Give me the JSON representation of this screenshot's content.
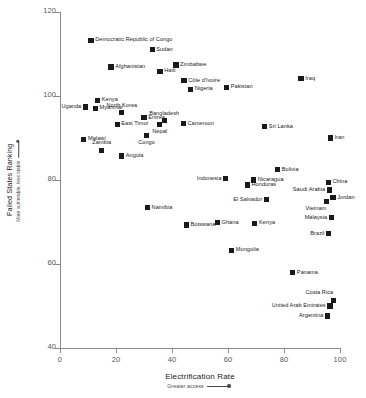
{
  "chart_data": {
    "type": "scatter",
    "title": "",
    "xlabel": "Electrification Rate",
    "xlabel_sub": "Greater access",
    "ylabel": "Failed States Ranking",
    "ylabel_sub": "More vulnerable, less stable",
    "xlim": [
      0,
      100
    ],
    "ylim": [
      40,
      120
    ],
    "xticks": [
      0,
      20,
      40,
      60,
      80,
      100
    ],
    "yticks": [
      40,
      60,
      80,
      100,
      120
    ],
    "grid": false,
    "legend": "none",
    "points": [
      {
        "label": "Democratic Republic of Congo",
        "x": 11.1,
        "y": 113.3,
        "pos": "lab-right"
      },
      {
        "label": "Sudan",
        "x": 32.9,
        "y": 111.0,
        "pos": "lab-right"
      },
      {
        "label": "Zimbabwe",
        "x": 41.4,
        "y": 107.4,
        "pos": "lab-right"
      },
      {
        "label": "Afghanistan",
        "x": 18.2,
        "y": 106.9,
        "pos": "lab-right"
      },
      {
        "label": "Haiti",
        "x": 35.7,
        "y": 105.9,
        "pos": "lab-right"
      },
      {
        "label": "Côte d'Ivoire",
        "x": 44.3,
        "y": 103.6,
        "pos": "lab-right"
      },
      {
        "label": "Iraq",
        "x": 86.1,
        "y": 104.1,
        "pos": "lab-right"
      },
      {
        "label": "Nigeria",
        "x": 46.6,
        "y": 101.6,
        "pos": "lab-right"
      },
      {
        "label": "Pakistan",
        "x": 59.5,
        "y": 102.1,
        "pos": "lab-right"
      },
      {
        "label": "Kenya",
        "x": 13.4,
        "y": 99.0,
        "pos": "lab-right"
      },
      {
        "label": "Uganda",
        "x": 9.1,
        "y": 97.4,
        "pos": "lab-left"
      },
      {
        "label": "Myanmar",
        "x": 12.6,
        "y": 97.1,
        "pos": "lab-right"
      },
      {
        "label": "North Korea",
        "x": 22.1,
        "y": 96.1,
        "pos": "lab-above"
      },
      {
        "label": "Eritrea",
        "x": 30.0,
        "y": 94.9,
        "pos": "lab-right"
      },
      {
        "label": "Bangladesh",
        "x": 37.2,
        "y": 94.2,
        "pos": "lab-above"
      },
      {
        "label": "East Timor",
        "x": 20.4,
        "y": 93.3,
        "pos": "lab-right"
      },
      {
        "label": "Cameroon",
        "x": 44.0,
        "y": 93.4,
        "pos": "lab-right"
      },
      {
        "label": "Nepal",
        "x": 35.6,
        "y": 93.2,
        "pos": "lab-below"
      },
      {
        "label": "Sri Lanka",
        "x": 73.1,
        "y": 92.7,
        "pos": "lab-right"
      },
      {
        "label": "Congo",
        "x": 30.9,
        "y": 90.6,
        "pos": "lab-below"
      },
      {
        "label": "Iran",
        "x": 96.6,
        "y": 90.0,
        "pos": "lab-right"
      },
      {
        "label": "Malawi",
        "x": 8.5,
        "y": 89.7,
        "pos": "lab-right"
      },
      {
        "label": "Zambia",
        "x": 14.9,
        "y": 87.1,
        "pos": "lab-above"
      },
      {
        "label": "Angola",
        "x": 22.0,
        "y": 85.7,
        "pos": "lab-right"
      },
      {
        "label": "Bolivia",
        "x": 77.7,
        "y": 82.5,
        "pos": "lab-right"
      },
      {
        "label": "Indonesia",
        "x": 59.2,
        "y": 80.4,
        "pos": "lab-left"
      },
      {
        "label": "Nicaragua",
        "x": 69.1,
        "y": 80.0,
        "pos": "lab-right"
      },
      {
        "label": "China",
        "x": 95.8,
        "y": 79.5,
        "pos": "lab-right"
      },
      {
        "label": "Honduras",
        "x": 66.9,
        "y": 78.8,
        "pos": "lab-right"
      },
      {
        "label": "Saudi Arabia",
        "x": 96.2,
        "y": 77.6,
        "pos": "lab-left"
      },
      {
        "label": "Jordan",
        "x": 97.5,
        "y": 75.8,
        "pos": "lab-right"
      },
      {
        "label": "El Salvador",
        "x": 73.8,
        "y": 75.4,
        "pos": "lab-left"
      },
      {
        "label": "Vietnam",
        "x": 95.1,
        "y": 74.9,
        "pos": "lab-below-left"
      },
      {
        "label": "Namibia",
        "x": 31.2,
        "y": 73.5,
        "pos": "lab-right"
      },
      {
        "label": "Malaysia",
        "x": 96.9,
        "y": 71.1,
        "pos": "lab-left"
      },
      {
        "label": "Ghana",
        "x": 56.2,
        "y": 69.9,
        "pos": "lab-right"
      },
      {
        "label": "Botswana",
        "x": 45.1,
        "y": 69.3,
        "pos": "lab-right"
      },
      {
        "label": "Kenya ",
        "x": 69.6,
        "y": 69.7,
        "pos": "lab-right"
      },
      {
        "label": "Brazil",
        "x": 96.0,
        "y": 67.2,
        "pos": "lab-left"
      },
      {
        "label": "Mongolia",
        "x": 61.3,
        "y": 63.3,
        "pos": "lab-right"
      },
      {
        "label": "Panama",
        "x": 83.1,
        "y": 57.9,
        "pos": "lab-right"
      },
      {
        "label": "Costa Rica",
        "x": 97.6,
        "y": 51.4,
        "pos": "lab-above-left"
      },
      {
        "label": "United Arab Emirates",
        "x": 96.4,
        "y": 50.0,
        "pos": "lab-left"
      },
      {
        "label": "Argentina",
        "x": 95.6,
        "y": 47.6,
        "pos": "lab-left"
      }
    ]
  }
}
